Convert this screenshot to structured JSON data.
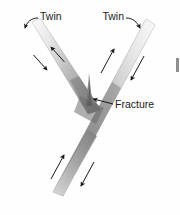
{
  "figure": {
    "background_color": "#fefefe",
    "width": 180,
    "height": 215
  },
  "labels": {
    "twin_left": "Twin",
    "twin_right": "Twin",
    "fracture": "Fracture"
  },
  "colors": {
    "band_light": "#ededed",
    "band_mid": "#bdbdbd",
    "band_dark": "#8a8a8a",
    "band_darkest": "#6e6e6e",
    "outline": "#9a9a9a",
    "arrow": "#171717",
    "leader": "#171717",
    "text": "#1a1a1a",
    "edge_mark": "#8e8e8e"
  },
  "elements": {
    "left_twin_band": "left deformation twin band, runs from upper-left down to the junction",
    "right_twin_band": "right deformation twin band, runs from upper-right through the junction down to lower-left",
    "fracture_spike": "narrow tapered crack rising vertically from the twin intersection",
    "junction": "intersection of the two twin bands"
  },
  "shear_arrows": [
    {
      "id": "left-band-upper-arrow",
      "band": "left",
      "side": "upper-right",
      "direction": "up-right"
    },
    {
      "id": "left-band-lower-arrow",
      "band": "left",
      "side": "lower-left",
      "direction": "down-left"
    },
    {
      "id": "right-band-upper-left-arrow",
      "band": "right-upper",
      "side": "left",
      "direction": "up-right"
    },
    {
      "id": "right-band-upper-right-arrow",
      "band": "right-upper",
      "side": "right",
      "direction": "down-left"
    },
    {
      "id": "right-band-lower-left-arrow",
      "band": "right-lower",
      "side": "left",
      "direction": "up-right"
    },
    {
      "id": "right-band-lower-right-arrow",
      "band": "right-lower",
      "side": "right",
      "direction": "down-left"
    }
  ],
  "leaders": [
    {
      "id": "twin-left-leader",
      "from_label": "Twin",
      "points_to": "left twin band"
    },
    {
      "id": "twin-right-leader",
      "from_label": "Twin",
      "points_to": "right twin band"
    },
    {
      "id": "fracture-leader",
      "from_label": "Fracture",
      "points_to": "fracture spike at junction"
    }
  ]
}
